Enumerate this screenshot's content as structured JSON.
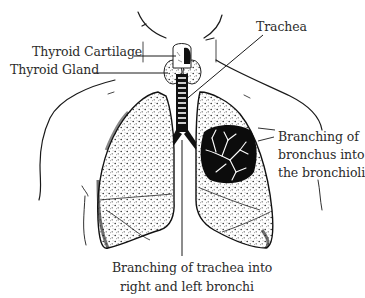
{
  "diagram": {
    "labels": {
      "thyroid_cartilage": "Thyroid Cartilage",
      "thyroid_gland": "Thyroid Gland",
      "trachea": "Trachea",
      "bronchus_branching": {
        "line1": "Branching of",
        "line2": "bronchus into",
        "line3": "the bronchioli"
      },
      "trachea_branching": {
        "line1": "Branching of trachea into",
        "line2": "right and left bronchi"
      }
    },
    "colors": {
      "ink": "#111111",
      "label_text": "#2b2b2b",
      "background": "#ffffff"
    }
  }
}
